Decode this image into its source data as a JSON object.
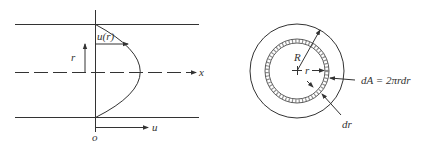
{
  "figure": {
    "left_panel": {
      "title": "Velocity profile in pipe",
      "labels": {
        "velocity_profile": "u(r)",
        "radius": "r",
        "axis_x": "x",
        "axis_u": "u",
        "origin": "o"
      }
    },
    "right_panel": {
      "title": "Pipe cross-section annular element",
      "labels": {
        "outer_radius": "R",
        "inner_radius": "r",
        "area_element": "dA = 2πrdr",
        "thickness": "dr"
      }
    },
    "colors": {
      "stroke": "#333333",
      "background": "#ffffff"
    }
  }
}
